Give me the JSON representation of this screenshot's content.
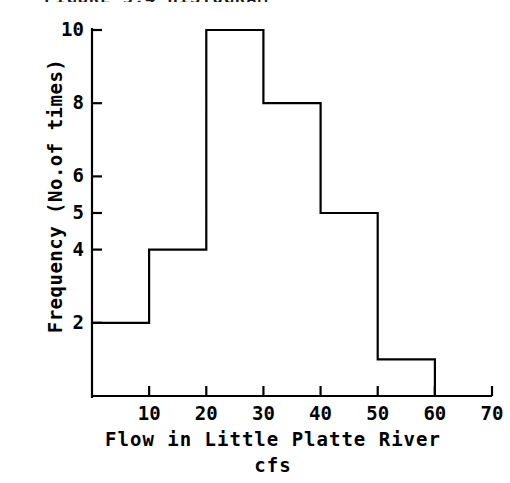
{
  "title_fragment": "FIGURE 5.4  HISTOGRAM",
  "chart_data": {
    "type": "bar",
    "subtype": "histogram-step-outline",
    "title": "",
    "xlabel": "Flow in Little Platte River",
    "xlabel_line2": "cfs",
    "ylabel": "Frequency (No.of times)",
    "bin_width": 10,
    "bin_edges": [
      0,
      10,
      20,
      30,
      40,
      50,
      60
    ],
    "categories": [
      "0-10",
      "10-20",
      "20-30",
      "30-40",
      "40-50",
      "50-60"
    ],
    "values": [
      2,
      4,
      10,
      8,
      5,
      1
    ],
    "xlim": [
      0,
      70
    ],
    "ylim": [
      0,
      10
    ],
    "xticks": [
      10,
      20,
      30,
      40,
      50,
      60,
      70
    ],
    "xtick_labels": [
      "10",
      "20",
      "30",
      "40",
      "50",
      "60",
      "70"
    ],
    "yticks": [
      2,
      4,
      5,
      6,
      8,
      10
    ],
    "ytick_labels": [
      "2",
      "4",
      "5",
      "6",
      "8",
      "10"
    ],
    "grid": false,
    "legend": false,
    "line_color": "#000000",
    "fill": "none",
    "axis_color": "#000000"
  }
}
